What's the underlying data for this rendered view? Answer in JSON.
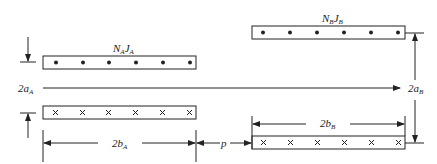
{
  "diagram": {
    "coil_a": {
      "label_main": "N",
      "label_sub1": "A",
      "label_mid": "J",
      "label_sub2": "A",
      "top_marks": "dot",
      "bottom_marks": "cross",
      "mark_count": 6
    },
    "coil_b": {
      "label_main": "N",
      "label_sub1": "B",
      "label_mid": "J",
      "label_sub2": "B",
      "top_marks": "dot",
      "bottom_marks": "cross",
      "mark_count": 6
    },
    "dimensions": {
      "a_height": {
        "main": "2a",
        "sub": "A"
      },
      "b_height": {
        "main": "2a",
        "sub": "B"
      },
      "a_width": {
        "main": "2b",
        "sub": "A"
      },
      "b_width": {
        "main": "2b",
        "sub": "B"
      },
      "gap": "p"
    },
    "colors": {
      "stroke": "#222222",
      "background": "#ffffff"
    }
  }
}
